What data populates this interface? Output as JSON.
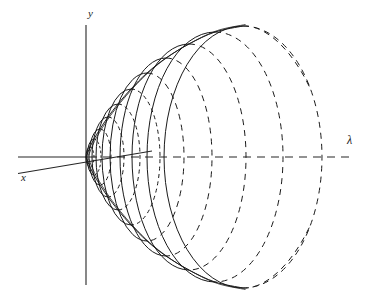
{
  "figure": {
    "kind": "mathematical-diagram",
    "background_color": "#ffffff",
    "stroke_color": "#1a1a1a",
    "width": 379,
    "height": 306
  },
  "labels": {
    "y_axis": "y",
    "x_axis": "x",
    "lambda_axis": "λ"
  },
  "chart_data": {
    "type": "line",
    "title": "",
    "xlabel": "λ",
    "ylabel": "y",
    "grid": false,
    "legend": null,
    "origin": {
      "x": 86,
      "y": 157
    },
    "axes": [
      {
        "name": "y-axis",
        "style": "solid",
        "x1": 86,
        "y1": 25,
        "x2": 86,
        "y2": 285,
        "label": "y",
        "label_x": 92,
        "label_y": 14
      },
      {
        "name": "lambda-axis-left-solid",
        "style": "solid",
        "x1": 18,
        "y1": 157,
        "x2": 88,
        "y2": 157
      },
      {
        "name": "lambda-axis-right-dashed",
        "style": "dashed",
        "x1": 88,
        "y1": 157,
        "x2": 350,
        "y2": 157,
        "label": "λ",
        "label_x": 352,
        "label_y": 143
      },
      {
        "name": "x-axis-oblique",
        "style": "solid",
        "x1": 18,
        "y1": 173,
        "x2": 152,
        "y2": 151,
        "label": "x",
        "label_x": 25,
        "label_y": 178
      }
    ],
    "ellipses": [
      {
        "index": 1,
        "cx": 90,
        "cy": 157,
        "rx": 4,
        "ry": 10
      },
      {
        "index": 2,
        "cx": 94,
        "cy": 157,
        "rx": 7,
        "ry": 18
      },
      {
        "index": 3,
        "cx": 100,
        "cy": 157,
        "rx": 11,
        "ry": 28
      },
      {
        "index": 4,
        "cx": 108,
        "cy": 157,
        "rx": 16,
        "ry": 40
      },
      {
        "index": 5,
        "cx": 118,
        "cy": 157,
        "rx": 22,
        "ry": 53
      },
      {
        "index": 6,
        "cx": 131,
        "cy": 157,
        "rx": 29,
        "ry": 68
      },
      {
        "index": 7,
        "cx": 147,
        "cy": 157,
        "rx": 37,
        "ry": 84
      },
      {
        "index": 8,
        "cx": 166,
        "cy": 157,
        "rx": 46,
        "ry": 99
      },
      {
        "index": 9,
        "cx": 189,
        "cy": 157,
        "rx": 57,
        "ry": 113
      },
      {
        "index": 10,
        "cx": 215,
        "cy": 157,
        "rx": 68,
        "ry": 125
      },
      {
        "index": 11,
        "cx": 243,
        "cy": 157,
        "rx": 79,
        "ry": 131
      }
    ],
    "ellipse_rendering": {
      "left_half": "solid",
      "right_half": "dashed",
      "note": "Each cross-section circle is drawn in perspective; the near (left) half is solid and the far (right) half is dashed"
    },
    "envelopes": [
      {
        "name": "upper-envelope",
        "style": "dashed-over-solid",
        "description": "Upper generating curve of the surface from apex at origin sweeping up and right"
      },
      {
        "name": "lower-envelope",
        "style": "solid",
        "description": "Lower generating curve of the surface from apex at origin sweeping down and right"
      }
    ],
    "apex": {
      "x": 86,
      "y": 157
    },
    "axis_ranges": {
      "lambda": [
        18,
        350
      ],
      "y": [
        25,
        285
      ]
    }
  }
}
